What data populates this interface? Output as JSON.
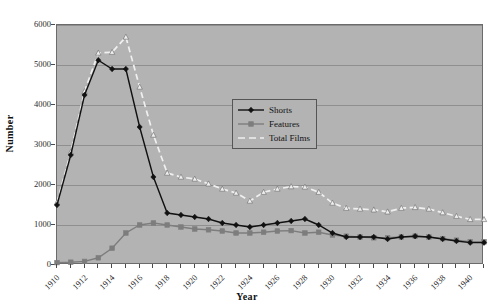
{
  "chart_data": {
    "type": "line",
    "title": "",
    "xlabel": "Year",
    "ylabel": "Number",
    "xlim": [
      1910,
      1941
    ],
    "ylim": [
      0,
      6000
    ],
    "ytick_values": [
      0,
      1000,
      2000,
      3000,
      4000,
      5000,
      6000
    ],
    "ytick_labels": [
      "0",
      "1000",
      "2000",
      "3000",
      "4000",
      "5000",
      "6000"
    ],
    "xtick_values": [
      1910,
      1911,
      1912,
      1913,
      1914,
      1915,
      1916,
      1917,
      1918,
      1919,
      1920,
      1921,
      1922,
      1923,
      1924,
      1925,
      1926,
      1927,
      1928,
      1929,
      1930,
      1931,
      1932,
      1933,
      1934,
      1935,
      1936,
      1937,
      1938,
      1939,
      1940,
      1941
    ],
    "xtick_labels_shown": [
      "1910",
      "1912",
      "1914",
      "1916",
      "1918",
      "1920",
      "1922",
      "1924",
      "1926",
      "1928",
      "1930",
      "1932",
      "1934",
      "1936",
      "1938",
      "1940"
    ],
    "grid": true,
    "legend_position": "center",
    "plot_background": "#b3b3b3",
    "x": [
      1910,
      1911,
      1912,
      1913,
      1914,
      1915,
      1916,
      1917,
      1918,
      1919,
      1920,
      1921,
      1922,
      1923,
      1924,
      1925,
      1926,
      1927,
      1928,
      1929,
      1930,
      1931,
      1932,
      1933,
      1934,
      1935,
      1936,
      1937,
      1938,
      1939,
      1940,
      1941
    ],
    "series": [
      {
        "name": "Shorts",
        "color": "#111111",
        "style": "solid",
        "marker": "diamond",
        "values": [
          1500,
          2750,
          4250,
          5120,
          4900,
          4900,
          3450,
          2200,
          1300,
          1250,
          1200,
          1150,
          1050,
          1000,
          950,
          1000,
          1050,
          1100,
          1150,
          1000,
          800,
          700,
          700,
          700,
          650,
          700,
          720,
          700,
          650,
          600,
          560,
          560
        ]
      },
      {
        "name": "Features",
        "color": "#7d7d7d",
        "style": "solid",
        "marker": "square",
        "values": [
          60,
          70,
          90,
          180,
          420,
          800,
          1000,
          1050,
          1000,
          950,
          900,
          880,
          850,
          800,
          800,
          820,
          850,
          860,
          800,
          820,
          750,
          720,
          700,
          680,
          680,
          700,
          720,
          700,
          660,
          620,
          580,
          580
        ]
      },
      {
        "name": "Total Films",
        "color": "#f0f0f0",
        "style": "dashed",
        "marker": "triangle",
        "values": [
          1560,
          2820,
          4340,
          5300,
          5320,
          5700,
          4450,
          3250,
          2300,
          2200,
          2150,
          2030,
          1900,
          1800,
          1600,
          1820,
          1900,
          1960,
          1950,
          1820,
          1550,
          1420,
          1400,
          1380,
          1330,
          1420,
          1440,
          1400,
          1310,
          1220,
          1140,
          1140
        ]
      }
    ]
  }
}
